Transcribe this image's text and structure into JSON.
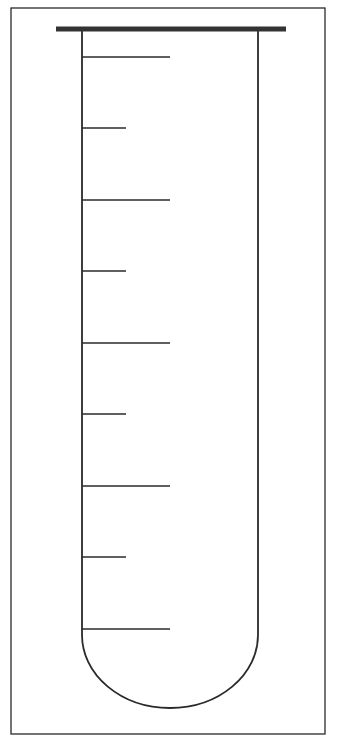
{
  "diagram": {
    "type": "test-tube-graduated",
    "colors": {
      "background": "#ffffff",
      "stroke": "#2a2a2a",
      "rim": "#333333"
    },
    "frame": {
      "x": 11,
      "y": 8,
      "w": 314,
      "h": 726
    },
    "rim": {
      "x1": 56,
      "x2": 286,
      "y": 29,
      "thickness": 5
    },
    "tube": {
      "left_x": 82,
      "right_x": 258,
      "top_y": 29,
      "straight_bottom_y": 635,
      "bottom_y": 708
    },
    "ticks": [
      {
        "y": 57,
        "length": "long"
      },
      {
        "y": 128,
        "length": "short"
      },
      {
        "y": 200,
        "length": "long"
      },
      {
        "y": 271,
        "length": "short"
      },
      {
        "y": 343,
        "length": "long"
      },
      {
        "y": 414,
        "length": "short"
      },
      {
        "y": 486,
        "length": "long"
      },
      {
        "y": 557,
        "length": "short"
      },
      {
        "y": 629,
        "length": "long"
      }
    ],
    "tick_end_x": {
      "long": 170,
      "short": 126
    }
  }
}
